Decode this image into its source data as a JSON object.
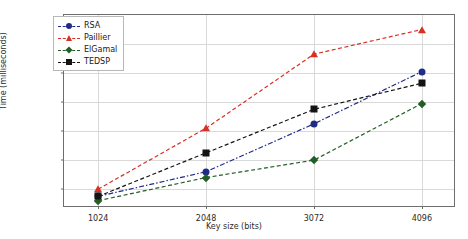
{
  "chart_data": {
    "type": "line",
    "title": "",
    "xlabel": "Key size (bits)",
    "ylabel": "Time (milliseconds)",
    "categories": [
      "1024",
      "2048",
      "3072",
      "4096"
    ],
    "x": [
      1024,
      2048,
      3072,
      4096
    ],
    "xlim": [
      700,
      4420
    ],
    "ylim": [
      7,
      140
    ],
    "yticks": [
      20,
      40,
      60,
      80,
      100,
      120
    ],
    "xticks": [
      1024,
      2048,
      3072,
      4096
    ],
    "grid": true,
    "legend_position": "upper left",
    "series": [
      {
        "name": "RSA",
        "values": [
          15,
          32,
          65,
          101
        ],
        "color": "#1f2a8a",
        "marker": "circle",
        "linestyle": "dashdot"
      },
      {
        "name": "Paillier",
        "values": [
          20,
          62,
          113,
          130
        ],
        "color": "#d93025",
        "marker": "triangle",
        "linestyle": "dashed"
      },
      {
        "name": "ElGamal",
        "values": [
          12,
          28,
          40,
          79
        ],
        "color": "#215f26",
        "marker": "diamond",
        "linestyle": "dashed"
      },
      {
        "name": "TEDSP",
        "values": [
          15,
          45,
          75,
          93
        ],
        "color": "#141414",
        "marker": "square",
        "linestyle": "dashed"
      }
    ]
  }
}
